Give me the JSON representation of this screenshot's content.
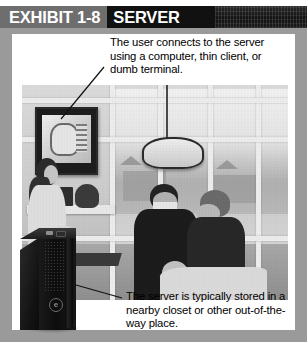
{
  "header": {
    "exhibit_label": "EXHIBIT 1-8",
    "title": "SERVER",
    "credit": "Photo credit: reproduced with permission",
    "band_gray": "#6e6e6e",
    "band_black": "#111111"
  },
  "callouts": {
    "top": "The user connects to the server using a computer, thin client, or dumb terminal.",
    "bottom": "The server is typically stored in a nearby closet or other out-of-the-way place."
  },
  "figure": {
    "photo_alt": "Dental office treatment room with staff, patient and a wall mounted computer monitor",
    "server_alt": "Black tower server computer",
    "server_badge": "e",
    "frame_color": "#9a9a9a",
    "panel_color": "#ffffff"
  }
}
